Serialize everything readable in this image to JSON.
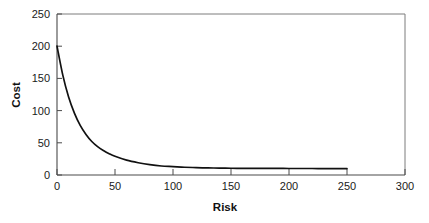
{
  "chart_data": {
    "type": "line",
    "title": "",
    "xlabel": "Risk",
    "ylabel": "Cost",
    "xlim": [
      0,
      300
    ],
    "ylim": [
      0,
      250
    ],
    "xticks": [
      0,
      50,
      100,
      150,
      200,
      250,
      300
    ],
    "yticks": [
      0,
      50,
      100,
      150,
      200,
      250
    ],
    "xtick_labels": [
      "0",
      "50",
      "100",
      "150",
      "200",
      "250",
      "300"
    ],
    "ytick_labels": [
      "0",
      "50",
      "100",
      "150",
      "200",
      "250"
    ],
    "grid": false,
    "legend": null,
    "series": [
      {
        "name": "Cost vs Risk",
        "color": "#111111",
        "x": [
          0,
          5,
          10,
          15,
          20,
          25,
          30,
          35,
          40,
          45,
          50,
          60,
          70,
          80,
          90,
          100,
          110,
          120,
          130,
          140,
          150,
          160,
          170,
          180,
          190,
          200,
          210,
          220,
          230,
          240,
          250
        ],
        "y": [
          200,
          155,
          121,
          96,
          77,
          63,
          52,
          44,
          38,
          33,
          29,
          23,
          19,
          16,
          14,
          13,
          12,
          11.5,
          11,
          10.8,
          10.5,
          10.4,
          10.3,
          10.2,
          10.2,
          10.1,
          10.1,
          10.1,
          10,
          10,
          10
        ]
      }
    ]
  },
  "axes": {
    "x_title": "Risk",
    "y_title": "Cost"
  }
}
